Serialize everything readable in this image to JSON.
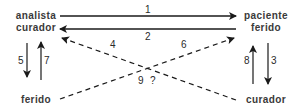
{
  "nodes": {
    "top_left": {
      "line1": "analista",
      "line2": "curador"
    },
    "top_right": {
      "line1": "paciente",
      "line2": "ferido"
    },
    "bottom_left": {
      "label": "ferido"
    },
    "bottom_right": {
      "label": "curador"
    }
  },
  "edges": [
    {
      "id": "1",
      "from": "analista curador",
      "to": "paciente ferido",
      "style": "solid"
    },
    {
      "id": "2",
      "from": "paciente ferido",
      "to": "analista curador",
      "style": "solid"
    },
    {
      "id": "3",
      "from": "paciente ferido",
      "to": "curador",
      "style": "solid"
    },
    {
      "id": "4",
      "from": "curador",
      "to": "analista curador",
      "style": "dashed"
    },
    {
      "id": "5",
      "from": "analista curador",
      "to": "ferido",
      "style": "solid"
    },
    {
      "id": "6",
      "from": "ferido",
      "to": "paciente ferido",
      "style": "dashed"
    },
    {
      "id": "7",
      "from": "ferido",
      "to": "analista curador",
      "style": "solid"
    },
    {
      "id": "8",
      "from": "curador",
      "to": "paciente ferido",
      "style": "solid"
    }
  ],
  "labels": {
    "e1": "1",
    "e2": "2",
    "e3": "3",
    "e4": "4",
    "e5": "5",
    "e6": "6",
    "e7": "7",
    "e8": "8",
    "e9": "9",
    "q": "?"
  },
  "colors": {
    "stroke": "#1a1a1a",
    "text": "#3a3a3a"
  }
}
